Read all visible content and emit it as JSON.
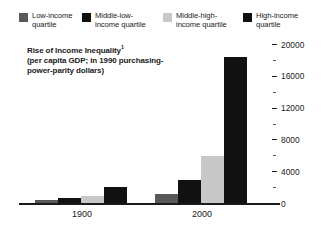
{
  "legend": {
    "items": [
      {
        "label": "Low-income quartile",
        "color": "#595959",
        "swatch_name": "legend-swatch-low-income"
      },
      {
        "label": "Middle-low-income quartile",
        "color": "#111111",
        "swatch_name": "legend-swatch-middle-low-income"
      },
      {
        "label": "Middle-high-income quartile",
        "color": "#c8c8c8",
        "swatch_name": "legend-swatch-middle-high-income"
      },
      {
        "label": "High-income quartile",
        "color": "#111111",
        "swatch_name": "legend-swatch-high-income"
      }
    ]
  },
  "title": "Rise of Income Inequality",
  "title_footnote_marker": "1",
  "subtitle": "(per capita GDP; in 1990 purchasing-power-parity dollars)",
  "chart_data": {
    "type": "bar",
    "title": "Rise of Income Inequality",
    "subtitle": "(per capita GDP; in 1990 purchasing-power-parity dollars)",
    "xlabel": "",
    "ylabel": "",
    "categories": [
      "1900",
      "2000"
    ],
    "series": [
      {
        "name": "Low-income quartile",
        "color": "#595959",
        "values": [
          500,
          1200
        ]
      },
      {
        "name": "Middle-low-income quartile",
        "color": "#111111",
        "values": [
          800,
          3000
        ]
      },
      {
        "name": "Middle-high-income quartile",
        "color": "#c8c8c8",
        "values": [
          1000,
          6000
        ]
      },
      {
        "name": "High-income quartile",
        "color": "#111111",
        "values": [
          2100,
          18500
        ]
      }
    ],
    "ylim": [
      0,
      20000
    ],
    "y_major_ticks": [
      0,
      4000,
      8000,
      12000,
      16000,
      20000
    ],
    "y_major_tick_labels": [
      "0",
      "4000",
      "8000",
      "12000",
      "16000",
      "20000"
    ],
    "y_minor_ticks": [
      2000,
      6000,
      10000,
      14000,
      18000
    ],
    "y_axis_position": "right",
    "grid": false,
    "legend_position": "top"
  }
}
